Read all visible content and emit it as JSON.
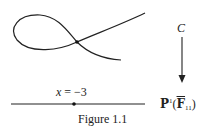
{
  "figure": {
    "caption": "Figure 1.1",
    "curve_label": "C",
    "point_label": "x = −3",
    "point_label_var": "x",
    "point_label_rest": " = −3",
    "base_label": {
      "space": "P",
      "superscript": "1",
      "field": "F",
      "subscript": "11"
    },
    "elements": {
      "curve": "nodal-cubic-curve",
      "node_point": "node-at-x-minus-3",
      "base_line": "projective-line",
      "arrow": "projection-map-arrow"
    }
  }
}
